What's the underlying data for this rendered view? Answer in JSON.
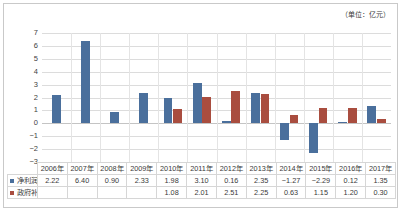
{
  "unit_note": "（单位：亿元）",
  "chart_data": {
    "type": "bar",
    "title": "",
    "subtitle": "",
    "xlabel": "",
    "ylabel": "",
    "unit": "亿元",
    "ylim": [
      -3,
      7
    ],
    "ytick_step": 1,
    "yticks": [
      "7",
      "6",
      "5",
      "4",
      "3",
      "2",
      "1",
      "0",
      "-1",
      "-2",
      "-3"
    ],
    "grid": true,
    "legend_position": "table-left",
    "categories": [
      "2006年",
      "2007年",
      "2008年",
      "2009年",
      "2010年",
      "2011年",
      "2012年",
      "2013年",
      "2014年",
      "2015年",
      "2016年",
      "2017年"
    ],
    "series": [
      {
        "name": "净利润",
        "color": "#4a6f9c",
        "values": [
          2.22,
          6.4,
          0.9,
          2.33,
          1.98,
          3.1,
          0.16,
          2.35,
          -1.27,
          -2.29,
          0.12,
          1.35
        ],
        "labels": [
          "2.22",
          "6.40",
          "0.90",
          "2.33",
          "1.98",
          "3.10",
          "0.16",
          "2.35",
          "-1.27",
          "-2.29",
          "0.12",
          "1.35"
        ]
      },
      {
        "name": "政府补贴",
        "color": "#a94d3f",
        "values": [
          null,
          null,
          null,
          null,
          1.08,
          2.01,
          2.51,
          2.25,
          0.63,
          1.15,
          1.2,
          0.3
        ],
        "labels": [
          "",
          "",
          "",
          "",
          "1.08",
          "2.01",
          "2.51",
          "2.25",
          "0.63",
          "1.15",
          "1.20",
          "0.30"
        ]
      }
    ]
  },
  "colors": {
    "profit": "#4a6f9c",
    "subsidy": "#a94d3f",
    "grid": "#dcdcdc",
    "border": "#c9c9c9",
    "text": "#3a3a3a"
  }
}
